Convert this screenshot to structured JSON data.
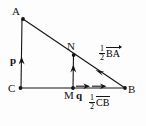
{
  "figure": {
    "type": "geometry-vector-diagram",
    "background_color": "#fdfdfd",
    "stroke_color": "#141414",
    "points": [
      {
        "name": "A",
        "label": "A",
        "x": 22,
        "y": 18
      },
      {
        "name": "C",
        "label": "C",
        "x": 20,
        "y": 88
      },
      {
        "name": "B",
        "label": "B",
        "x": 125,
        "y": 88
      },
      {
        "name": "M",
        "label": "M",
        "x": 73,
        "y": 88
      },
      {
        "name": "N",
        "label": "N",
        "x": 74,
        "y": 53
      }
    ],
    "vectors": [
      {
        "name": "p",
        "label": "p",
        "bold": true,
        "along": "C to A"
      },
      {
        "name": "q",
        "label": "q",
        "bold": true,
        "along": "M to B"
      }
    ],
    "expressions": [
      {
        "name": "half-BA",
        "numerator": "1",
        "denominator": "2",
        "vector_text": "BA"
      },
      {
        "name": "half-CB",
        "numerator": "1",
        "denominator": "2",
        "vector_text": "CB"
      }
    ],
    "labels": {
      "A": "A",
      "B": "B",
      "C": "C",
      "M": "M",
      "N": "N",
      "p": "p",
      "q": "q",
      "one": "1",
      "two": "2",
      "BA": "BA",
      "CB": "CB"
    }
  }
}
